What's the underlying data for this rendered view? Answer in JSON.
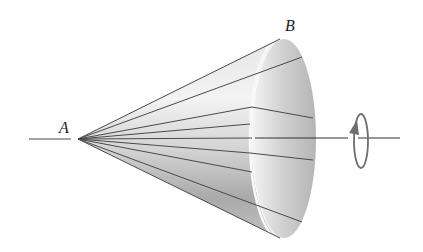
{
  "figure": {
    "labels": {
      "apex": "A",
      "rim": "B"
    },
    "colors": {
      "line": "#4a4a4a",
      "surface_light": "#f2f2f2",
      "surface_dark": "#9a9a9a",
      "base_fill": "#c8c8c8",
      "arrow": "#6e6e6e"
    },
    "rotation_indicator": "rotation-arrow-icon"
  }
}
